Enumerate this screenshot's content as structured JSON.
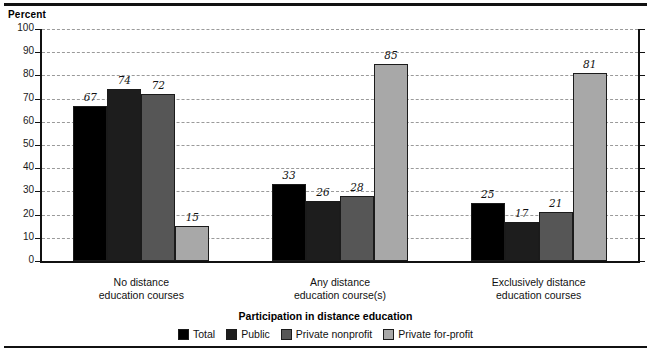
{
  "chart_data": {
    "type": "bar",
    "title": "",
    "xlabel": "Participation in distance education",
    "ylabel": "Percent",
    "ylim": [
      0,
      100
    ],
    "ytick_step": 10,
    "yticks": [
      0,
      10,
      20,
      30,
      40,
      50,
      60,
      70,
      80,
      90,
      100
    ],
    "grid": true,
    "legend_position": "bottom",
    "categories": [
      "No distance\neducation courses",
      "Any distance\neducation course(s)",
      "Exclusively distance\neducation courses"
    ],
    "category_lines": [
      [
        "No distance",
        "education courses"
      ],
      [
        "Any distance",
        "education course(s)"
      ],
      [
        "Exclusively distance",
        "education courses"
      ]
    ],
    "series": [
      {
        "name": "Total",
        "color": "#000000",
        "values": [
          67,
          33,
          25
        ]
      },
      {
        "name": "Public",
        "color": "#1d1d1d",
        "values": [
          74,
          26,
          17
        ]
      },
      {
        "name": "Private nonprofit",
        "color": "#565656",
        "values": [
          72,
          28,
          21
        ]
      },
      {
        "name": "Private for-profit",
        "color": "#a8a8a8",
        "values": [
          15,
          85,
          81
        ]
      }
    ]
  },
  "legend": {
    "items": [
      {
        "label": "Total"
      },
      {
        "label": "Public"
      },
      {
        "label": "Private nonprofit"
      },
      {
        "label": "Private for-profit"
      }
    ]
  }
}
